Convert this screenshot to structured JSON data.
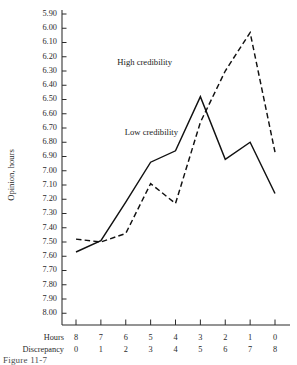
{
  "figure": {
    "caption": "Figure 11-7"
  },
  "chart_data": {
    "type": "line",
    "title": "",
    "xlabel": "",
    "ylabel": "Opinion, hours",
    "grid": false,
    "legend_position": "inline-annotation",
    "y_inverted": true,
    "ylim": [
      5.9,
      8.0
    ],
    "y_ticks": [
      "5.90",
      "6.00",
      "6.10",
      "6.20",
      "6.30",
      "6.40",
      "6.50",
      "6.60",
      "6.70",
      "6.80",
      "6.90",
      "7.00",
      "7.10",
      "7.20",
      "7.30",
      "7.40",
      "7.50",
      "7.60",
      "7.70",
      "7.80",
      "7.90",
      "8.00"
    ],
    "x_axis_rows": [
      {
        "name": "Hours",
        "label": "Hours",
        "ticks": [
          "8",
          "7",
          "6",
          "5",
          "4",
          "3",
          "2",
          "1",
          "0"
        ]
      },
      {
        "name": "Discrepancy",
        "label": "Discrepancy",
        "ticks": [
          "0",
          "1",
          "2",
          "3",
          "4",
          "5",
          "6",
          "7",
          "8"
        ]
      }
    ],
    "categories": [
      "8",
      "7",
      "6",
      "5",
      "4",
      "3",
      "2",
      "1",
      "0"
    ],
    "series": [
      {
        "name": "Low credibility",
        "label": "Low credibility",
        "style": "solid",
        "color": "#111111",
        "values": [
          7.57,
          7.49,
          7.22,
          6.94,
          6.86,
          6.48,
          6.92,
          6.8,
          7.16
        ]
      },
      {
        "name": "High credibility",
        "label": "High credibility",
        "style": "dashed",
        "color": "#111111",
        "values": [
          7.48,
          7.5,
          7.44,
          7.09,
          7.23,
          6.66,
          6.3,
          6.03,
          6.87
        ]
      }
    ]
  }
}
